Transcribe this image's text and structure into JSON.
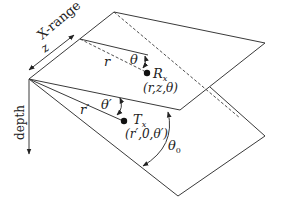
{
  "labels": {
    "x_range": "X-range",
    "z": "z",
    "depth": "depth",
    "r": "r",
    "theta": "θ",
    "receiver_name": "R",
    "receiver_sub": "x",
    "receiver_coords": "(r,z,θ)",
    "r_prime": "r′",
    "theta_prime": "θ′",
    "transmitter_name": "T",
    "transmitter_sub": "x",
    "transmitter_coords": "(r′,0,θ′)",
    "theta0": "θ",
    "theta0_sub": "0"
  }
}
